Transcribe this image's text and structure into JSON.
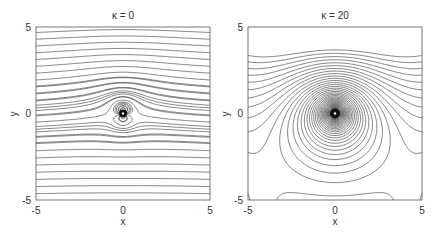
{
  "chart_data": [
    {
      "type": "contour",
      "title": "κ = 0",
      "xlabel": "x",
      "ylabel": "y",
      "xlim": [
        -5,
        5
      ],
      "ylim": [
        -5,
        5
      ],
      "xticks": [
        "-5",
        "0",
        "5"
      ],
      "yticks": [
        "-5",
        "0",
        "5"
      ],
      "grid": false,
      "description": "Streamlines: nearly horizontal lines deflected around a dipole-like singularity at the origin",
      "kappa": 0
    },
    {
      "type": "contour",
      "title": "κ = 20",
      "xlabel": "x",
      "ylabel": "y",
      "xlim": [
        -5,
        5
      ],
      "ylim": [
        -5,
        5
      ],
      "xticks": [
        "-5",
        "0",
        "5"
      ],
      "yticks": [
        "-5",
        "0",
        "5"
      ],
      "grid": false,
      "description": "Streamlines: nested arcs converging on a strong singularity at the origin, with a separatrix region below",
      "kappa": 20
    }
  ]
}
